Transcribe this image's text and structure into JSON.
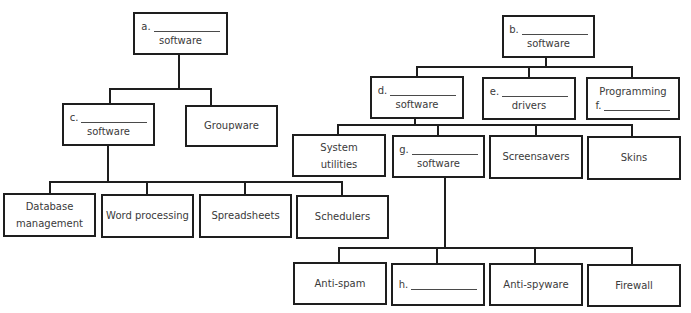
{
  "diagram": {
    "left_tree": {
      "root": {
        "letter": "a.",
        "suffix": "software"
      },
      "level1": [
        {
          "letter": "c.",
          "suffix": "software"
        },
        {
          "label": "Groupware"
        }
      ],
      "level2": [
        {
          "label": "Database management"
        },
        {
          "label": "Word processing"
        },
        {
          "label": "Spreadsheets"
        },
        {
          "label": "Schedulers"
        }
      ]
    },
    "right_tree": {
      "root": {
        "letter": "b.",
        "suffix": "software"
      },
      "level1": [
        {
          "letter": "d.",
          "suffix": "software"
        },
        {
          "letter": "e.",
          "suffix": "drivers"
        },
        {
          "prefix": "Programming",
          "letter": "f."
        }
      ],
      "level2": [
        {
          "label": "System utilities"
        },
        {
          "letter": "g.",
          "suffix": "software"
        },
        {
          "label": "Screensavers"
        },
        {
          "label": "Skins"
        }
      ],
      "level3": [
        {
          "label": "Anti-spam"
        },
        {
          "letter": "h."
        },
        {
          "label": "Anti-spyware"
        },
        {
          "label": "Firewall"
        }
      ]
    }
  }
}
